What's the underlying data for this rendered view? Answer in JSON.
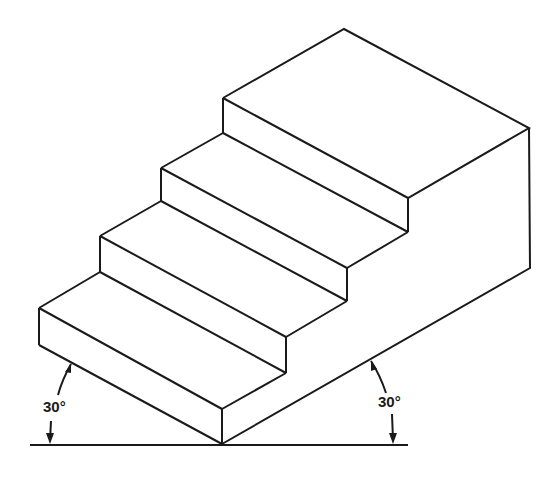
{
  "figure": {
    "angle_labels": {
      "left": "30°",
      "right": "30°"
    },
    "line_color": "#1a1a1a",
    "background": "#ffffff"
  }
}
